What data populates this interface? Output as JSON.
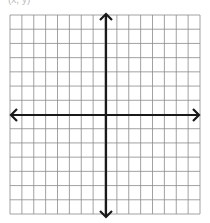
{
  "header": {
    "cut_label": "(x, y)"
  },
  "grid": {
    "left": 10,
    "top": 15,
    "right": 200,
    "bottom": 214,
    "columns": 16,
    "rows": 14,
    "line_color": "#8a8a8a",
    "axis_color": "#1a1a1a",
    "background": "#ffffff"
  },
  "axes": {
    "x_axis": {
      "y": 115,
      "arrow_left": true,
      "arrow_right": true
    },
    "y_axis": {
      "x": 106,
      "arrow_up": true,
      "arrow_down": true
    }
  }
}
